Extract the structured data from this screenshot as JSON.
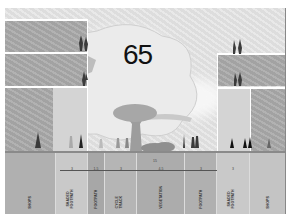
{
  "figure": {
    "number": "65",
    "type": "street-cross-section"
  },
  "section": {
    "total_width_label": "15",
    "columns": [
      {
        "id": "shops-left",
        "label": "SHOPS",
        "dimension": ""
      },
      {
        "id": "shaded-footpath-left",
        "label": "SHADED\nFOOTPATH",
        "dimension": "3"
      },
      {
        "id": "footpath-left",
        "label": "FOOTPATH",
        "dimension": "1.5"
      },
      {
        "id": "cycle-track",
        "label": "CYCLE\nTRACK",
        "dimension": "3"
      },
      {
        "id": "vegetation",
        "label": "VEGETATION",
        "dimension": "4.5"
      },
      {
        "id": "footpath-right",
        "label": "FOOTPATH",
        "dimension": "3"
      },
      {
        "id": "shaded-footpath-right",
        "label": "SHADED\nFOOTPATH",
        "dimension": "3"
      },
      {
        "id": "shops-right",
        "label": "SHOPS",
        "dimension": ""
      }
    ]
  },
  "colors": {
    "background": "#e4e4e4",
    "building": "#a9a9a9",
    "label_strip": "#b3b3b3",
    "floor_lines": "#ffffff",
    "figure_number": "#111111"
  }
}
